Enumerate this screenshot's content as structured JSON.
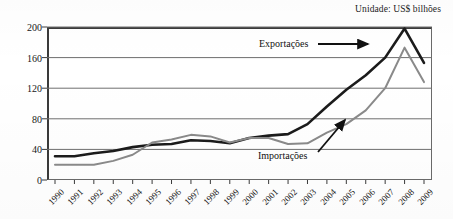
{
  "caption": {
    "unit_note": "Unidade: US$ bilhões"
  },
  "annotations": {
    "exports_label": "Exportações",
    "imports_label": "Importações"
  },
  "colors": {
    "exports_line": "#1b1b1b",
    "imports_line": "#8a8a8a",
    "gridline": "#6e6e6e",
    "axis": "#3a3a3a",
    "text": "#141414"
  },
  "chart_data": {
    "type": "line",
    "title": "",
    "subtitle": "",
    "xlabel": "",
    "ylabel": "",
    "unit_note": "Unidade: US$ bilhões",
    "grid": true,
    "legend_position": "in-plot-annotations",
    "ylim": [
      0,
      200
    ],
    "yticks": [
      0,
      40,
      80,
      120,
      160,
      200
    ],
    "ytick_labels": [
      "0",
      "40",
      "80",
      "120",
      "160",
      "200"
    ],
    "categories": [
      "1990",
      "1991",
      "1992",
      "1993",
      "1994",
      "1995",
      "1996",
      "1997",
      "1998",
      "1999",
      "2000",
      "2001",
      "2002",
      "2003",
      "2004",
      "2005",
      "2006",
      "2007",
      "2008",
      "2009"
    ],
    "series": [
      {
        "name": "Exportações",
        "color": "#1b1b1b",
        "values": [
          31,
          31,
          35,
          38,
          43,
          46,
          47,
          52,
          51,
          48,
          55,
          58,
          60,
          73,
          96,
          118,
          137,
          160,
          198,
          153
        ]
      },
      {
        "name": "Importações",
        "color": "#8a8a8a",
        "values": [
          20,
          20,
          20,
          25,
          33,
          49,
          53,
          59,
          57,
          49,
          55,
          55,
          47,
          48,
          62,
          73,
          91,
          120,
          173,
          128
        ]
      }
    ]
  }
}
